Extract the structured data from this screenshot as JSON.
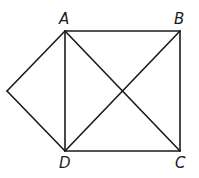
{
  "diagram": {
    "type": "geometry",
    "vertices": [
      {
        "id": "A",
        "label": "A",
        "x": 65,
        "y": 31,
        "label_x": 59,
        "label_y": 24
      },
      {
        "id": "B",
        "label": "B",
        "x": 180,
        "y": 31,
        "label_x": 174,
        "label_y": 24
      },
      {
        "id": "C",
        "label": "C",
        "x": 180,
        "y": 151,
        "label_x": 175,
        "label_y": 167
      },
      {
        "id": "D",
        "label": "D",
        "x": 65,
        "y": 151,
        "label_x": 59,
        "label_y": 167
      },
      {
        "id": "E",
        "label": "",
        "x": 7,
        "y": 91
      }
    ],
    "edges": [
      {
        "from": "A",
        "to": "B"
      },
      {
        "from": "B",
        "to": "C"
      },
      {
        "from": "C",
        "to": "D"
      },
      {
        "from": "D",
        "to": "A"
      },
      {
        "from": "A",
        "to": "C"
      },
      {
        "from": "B",
        "to": "D"
      },
      {
        "from": "E",
        "to": "A"
      },
      {
        "from": "E",
        "to": "D"
      }
    ],
    "labels": {
      "A": "A",
      "B": "B",
      "C": "C",
      "D": "D"
    }
  }
}
